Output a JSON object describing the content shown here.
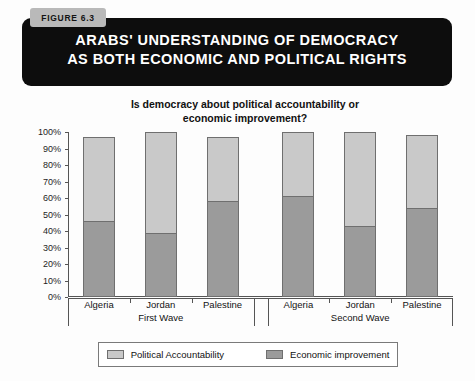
{
  "figure": {
    "tab_label": "FIGURE 6.3",
    "title_line1": "ARABS' UNDERSTANDING OF DEMOCRACY",
    "title_line2": "AS BOTH ECONOMIC AND POLITICAL RIGHTS"
  },
  "colors": {
    "banner_background": "#0d0d0d",
    "tab_background": "#b9b9b9",
    "political_accountability": "#c9c9c9",
    "economic_improvement": "#9b9b9b",
    "axis": "#555555"
  },
  "groups": [
    {
      "label": "First Wave"
    },
    {
      "label": "Second Wave"
    }
  ],
  "legend": {
    "items": [
      {
        "label": "Political Accountability",
        "color": "#c9c9c9"
      },
      {
        "label": "Economic improvement",
        "color": "#9b9b9b"
      }
    ]
  },
  "chart_data": {
    "type": "bar",
    "subtype": "stacked",
    "title": "ARABS' UNDERSTANDING OF DEMOCRACY AS BOTH ECONOMIC AND POLITICAL RIGHTS",
    "subtitle_line1": "Is democracy about political accountability or",
    "subtitle_line2": "economic improvement?",
    "xlabel": "",
    "ylabel": "",
    "ylim": [
      0,
      100
    ],
    "yticks": [
      "0%",
      "10%",
      "20%",
      "30%",
      "40%",
      "50%",
      "60%",
      "70%",
      "80%",
      "90%",
      "100%"
    ],
    "ytick_values": [
      0,
      10,
      20,
      30,
      40,
      50,
      60,
      70,
      80,
      90,
      100
    ],
    "grid": false,
    "legend_position": "bottom",
    "categories": [
      "Algeria",
      "Jordan",
      "Palestine",
      "Algeria",
      "Jordan",
      "Palestine"
    ],
    "group_of_category": [
      "First Wave",
      "First Wave",
      "First Wave",
      "Second Wave",
      "Second Wave",
      "Second Wave"
    ],
    "series": [
      {
        "name": "Economic improvement",
        "color": "#9b9b9b",
        "values": [
          46,
          39,
          58,
          61,
          43,
          54
        ]
      },
      {
        "name": "Political Accountability",
        "color": "#c9c9c9",
        "values": [
          51,
          61,
          39,
          39,
          57,
          44
        ]
      }
    ],
    "totals": [
      97,
      100,
      97,
      100,
      100,
      98
    ]
  }
}
